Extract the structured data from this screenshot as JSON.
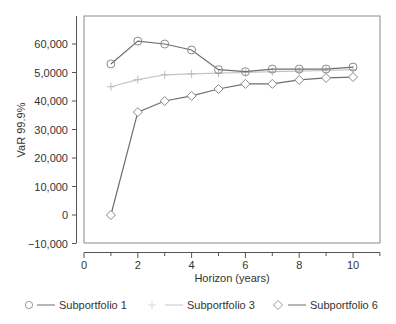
{
  "chart_data": {
    "type": "line",
    "title": "",
    "xlabel": "Horizon (years)",
    "ylabel": "VaR 99.9%",
    "xlim": [
      0,
      11
    ],
    "ylim": [
      -10000,
      70000
    ],
    "x_ticks": [
      0,
      1,
      2,
      3,
      4,
      5,
      6,
      7,
      8,
      9,
      10,
      11
    ],
    "x_tick_labels": [
      {
        "value": 0,
        "label": "0"
      },
      {
        "value": 2,
        "label": "2"
      },
      {
        "value": 4,
        "label": "4"
      },
      {
        "value": 6,
        "label": "6"
      },
      {
        "value": 8,
        "label": "8"
      },
      {
        "value": 10,
        "label": "10"
      }
    ],
    "y_tick_labels": [
      {
        "value": 60000,
        "label": "60,000"
      },
      {
        "value": 50000,
        "label": "5,0000"
      },
      {
        "value": 40000,
        "label": "40,000"
      },
      {
        "value": 30000,
        "label": "30,000"
      },
      {
        "value": 20000,
        "label": "20,000"
      },
      {
        "value": 10000,
        "label": "10,000"
      },
      {
        "value": 0,
        "label": "0"
      },
      {
        "value": -10000,
        "label": "−10,000"
      }
    ],
    "grid": false,
    "legend_position": "bottom",
    "x": [
      1,
      2,
      3,
      4,
      5,
      6,
      7,
      8,
      9,
      10
    ],
    "series": [
      {
        "name": "Subportfolio 1",
        "marker": "circle",
        "color": "#6e6e6e",
        "values": [
          53000,
          61000,
          60000,
          57900,
          51000,
          50300,
          51200,
          51200,
          51200,
          51900
        ]
      },
      {
        "name": "Subportfolio 3",
        "marker": "plus",
        "color": "#c4c4c4",
        "values": [
          45000,
          47500,
          49200,
          49500,
          49800,
          50000,
          50300,
          50500,
          50700,
          51000
        ]
      },
      {
        "name": "Subportfolio 6",
        "marker": "diamond",
        "color": "#6e6e6e",
        "values": [
          0,
          36100,
          40000,
          41800,
          44200,
          46000,
          46000,
          47400,
          48100,
          48400
        ]
      }
    ]
  },
  "legend": {
    "items": [
      {
        "label": "Subportfolio 1"
      },
      {
        "label": "Subportfolio 3"
      },
      {
        "label": "Subportfolio 6"
      }
    ]
  }
}
